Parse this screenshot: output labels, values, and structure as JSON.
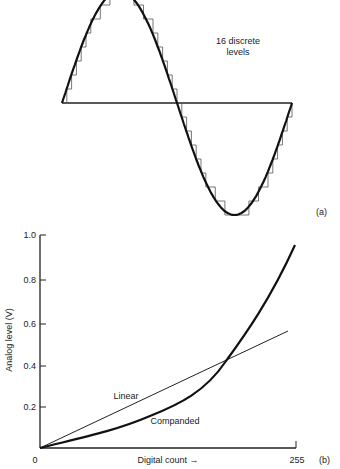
{
  "chart_data": [
    {
      "panel": "(a)",
      "type": "line",
      "title": "",
      "annotation": "16 discrete levels",
      "annotation_lines": [
        "16 discrete",
        "levels"
      ],
      "series": [
        {
          "name": "Sine wave",
          "style": "thick curve",
          "x": [
            0,
            0.25,
            0.5,
            0.75,
            1.0
          ],
          "y": [
            0,
            1,
            0,
            -1,
            0
          ]
        },
        {
          "name": "Quantized staircase",
          "style": "thin step",
          "levels": 16
        }
      ],
      "grid": false,
      "label": "(a)"
    },
    {
      "panel": "(b)",
      "type": "line",
      "title": "",
      "xlabel": "Digital count →",
      "ylabel": "Analog level (V)",
      "xlim": [
        0,
        255
      ],
      "ylim": [
        0,
        1.0
      ],
      "x_ticks": [
        "0",
        "255"
      ],
      "y_ticks": [
        "0.2",
        "0.4",
        "0.6",
        "0.8",
        "1.0"
      ],
      "series": [
        {
          "name": "Linear",
          "x": [
            0,
            250
          ],
          "y": [
            0,
            0.55
          ]
        },
        {
          "name": "Companded",
          "x": [
            0,
            60,
            110,
            150,
            185,
            209,
            229,
            254
          ],
          "y": [
            0,
            0.085,
            0.17,
            0.27,
            0.41,
            0.6,
            0.74,
            0.96
          ]
        }
      ],
      "annotations": [
        "Linear",
        "Companded"
      ],
      "grid": false,
      "label": "(b)"
    }
  ],
  "panel_a": {
    "annotation_line1": "16 discrete",
    "annotation_line2": "levels",
    "label": "(a)"
  },
  "panel_b": {
    "y_axis_title": "Analog level (V)",
    "x_axis_title": "Digital count →",
    "y_ticks": [
      "1.0",
      "0.8",
      "0.6",
      "0.4",
      "0.2"
    ],
    "x_tick_start": "0",
    "x_tick_end": "255",
    "linear_label": "Linear",
    "companded_label": "Companded",
    "label": "(b)"
  }
}
